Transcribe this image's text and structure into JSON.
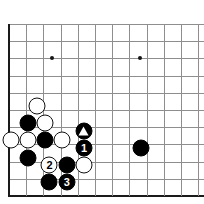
{
  "figure": {
    "kind": "go-board-diagram",
    "background_color": "#ffffff",
    "line_color": "#8e8e8e",
    "edge_color": "#1a1a1a",
    "black_color": "#000000",
    "white_color": "#ffffff"
  },
  "board": {
    "origin_x": 9,
    "origin_y": 24,
    "spacing": 17.2,
    "visible_columns": 12,
    "visible_rows": 11,
    "left_edge": true,
    "bottom_edge": true,
    "top_edge": false,
    "right_edge": false
  },
  "star_points": [
    {
      "name": "star-point-left",
      "col": 2.5,
      "row": 2
    },
    {
      "name": "star-point-right",
      "col": 7.6,
      "row": 2
    }
  ],
  "stones": [
    {
      "id": "w1",
      "color": "white",
      "col": 1.6,
      "row": 4.75,
      "label": "",
      "mark": ""
    },
    {
      "id": "b1",
      "color": "black",
      "col": 1.1,
      "row": 5.75,
      "label": "",
      "mark": ""
    },
    {
      "id": "w2",
      "color": "white",
      "col": 2.1,
      "row": 5.75,
      "label": "",
      "mark": ""
    },
    {
      "id": "bt",
      "color": "black",
      "col": 4.35,
      "row": 6.2,
      "label": "",
      "mark": "triangle"
    },
    {
      "id": "w3",
      "color": "white",
      "col": 0.1,
      "row": 6.75,
      "label": "",
      "mark": ""
    },
    {
      "id": "w4",
      "color": "white",
      "col": 1.1,
      "row": 6.75,
      "label": "",
      "mark": ""
    },
    {
      "id": "b2",
      "color": "black",
      "col": 2.1,
      "row": 6.75,
      "label": "",
      "mark": ""
    },
    {
      "id": "w5",
      "color": "white",
      "col": 3.1,
      "row": 6.75,
      "label": "",
      "mark": ""
    },
    {
      "id": "m1",
      "color": "black",
      "col": 4.35,
      "row": 7.2,
      "label": "1",
      "mark": ""
    },
    {
      "id": "br",
      "color": "black",
      "col": 7.65,
      "row": 7.2,
      "label": "",
      "mark": ""
    },
    {
      "id": "b3",
      "color": "black",
      "col": 1.1,
      "row": 7.8,
      "label": "",
      "mark": ""
    },
    {
      "id": "m2",
      "color": "white",
      "col": 2.35,
      "row": 8.2,
      "label": "2",
      "mark": ""
    },
    {
      "id": "b4",
      "color": "black",
      "col": 3.35,
      "row": 8.2,
      "label": "",
      "mark": ""
    },
    {
      "id": "w6",
      "color": "white",
      "col": 4.35,
      "row": 8.2,
      "label": "",
      "mark": ""
    },
    {
      "id": "b5",
      "color": "black",
      "col": 2.35,
      "row": 9.2,
      "label": "",
      "mark": ""
    },
    {
      "id": "m3",
      "color": "black",
      "col": 3.35,
      "row": 9.2,
      "label": "3",
      "mark": ""
    }
  ]
}
